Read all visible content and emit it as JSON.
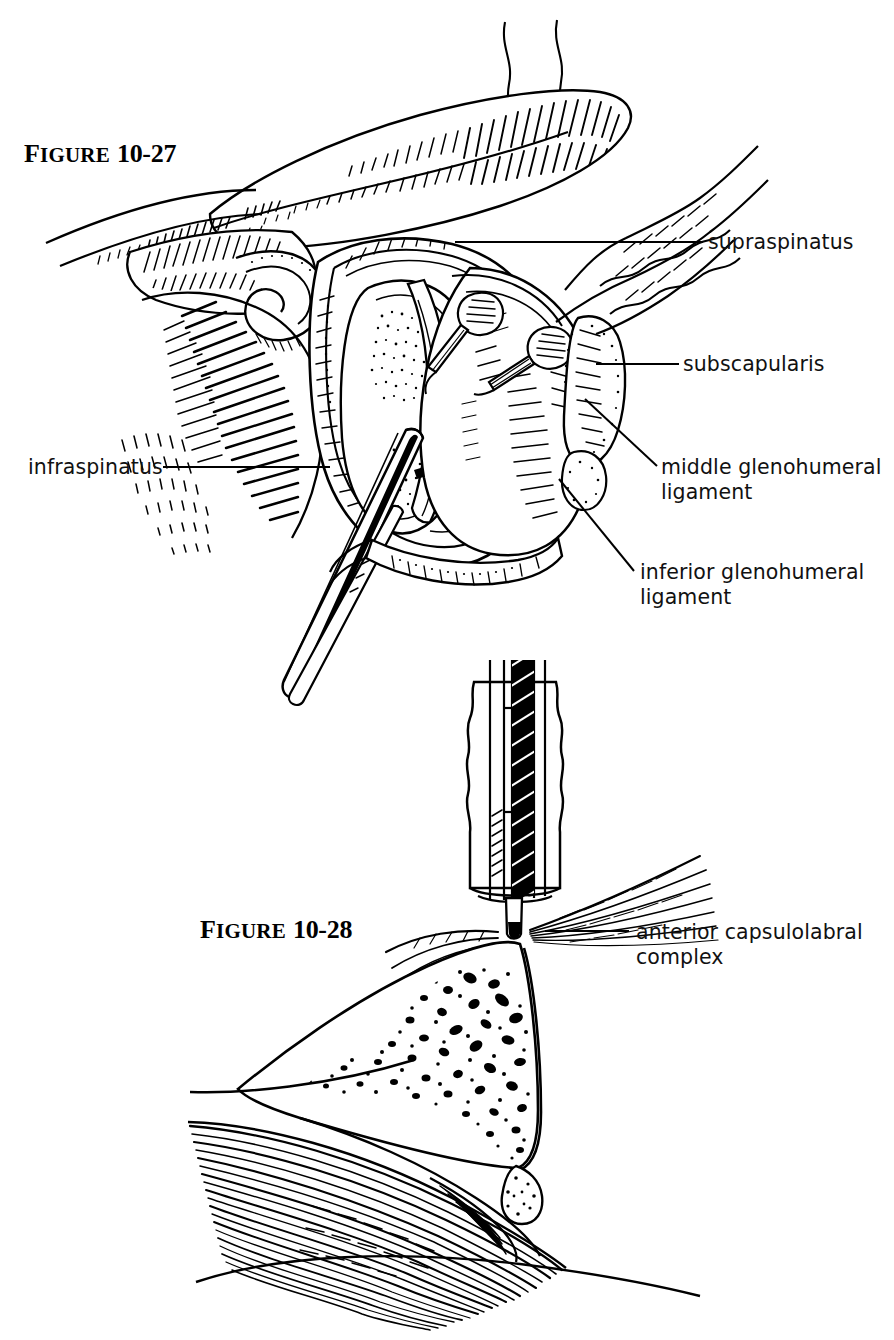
{
  "page": {
    "background": "#ffffff",
    "ink": "#000000",
    "width": 894,
    "height": 1340,
    "style": "pen-and-ink anatomical line drawing"
  },
  "figures": [
    {
      "id": "figure-10-27",
      "label_word": "Figure",
      "label_word_cap": "F",
      "label_word_rest": "IGURE",
      "number": "10-27",
      "subject": "arthroscopic view of the right glenohumeral joint with probe, showing rotator cuff and glenohumeral ligaments"
    },
    {
      "id": "figure-10-28",
      "label_word": "Figure",
      "label_word_cap": "F",
      "label_word_rest": "IGURE",
      "number": "10-28",
      "subject": "cannula and obturator placed against the anterior glenoid rim and capsulolabral tissue"
    }
  ],
  "annotations": {
    "supraspinatus": "supraspinatus",
    "subscapularis": "subscapularis",
    "middle_glenohumeral_ligament": "middle glenohumeral\nligament",
    "inferior_glenohumeral_ligament": "inferior glenohumeral\nligament",
    "infraspinatus": "infraspinatus",
    "anterior_capsulolabral_complex": "anterior capsulolabral\ncomplex"
  },
  "leader_lines": [
    {
      "name": "supraspinatus-leader",
      "from": [
        455,
        242
      ],
      "to": [
        703,
        242
      ],
      "shape": "horizontal"
    },
    {
      "name": "subscapularis-leader",
      "from": [
        596,
        364
      ],
      "to": [
        679,
        364
      ],
      "shape": "horizontal"
    },
    {
      "name": "middle-glenohumeral-leader",
      "from": [
        585,
        399
      ],
      "to": [
        657,
        466
      ],
      "shape": "diagonal"
    },
    {
      "name": "inferior-glenohumeral-leader",
      "from": [
        559,
        479
      ],
      "to": [
        634,
        571
      ],
      "shape": "diagonal"
    },
    {
      "name": "infraspinatus-leader",
      "from": [
        163,
        467
      ],
      "to": [
        330,
        467
      ],
      "shape": "horizontal"
    },
    {
      "name": "anterior-capsulolabral-leader",
      "from": [
        545,
        931
      ],
      "to": [
        629,
        931
      ],
      "shape": "horizontal"
    }
  ]
}
